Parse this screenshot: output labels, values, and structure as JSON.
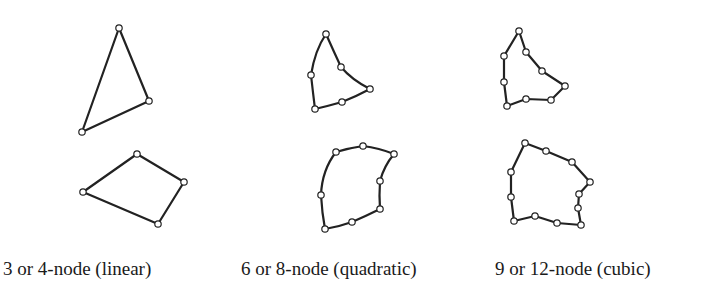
{
  "figure": {
    "colors": {
      "stroke": "#222222",
      "node_fill": "#ffffff",
      "text": "#1a1a1a",
      "background": "#ffffff"
    },
    "columns": [
      {
        "label": "3 or 4-node (linear)",
        "label_x": 3,
        "triangle": {
          "nodes": [
            [
              119,
              28
            ],
            [
              149,
              101
            ],
            [
              82,
              132
            ]
          ],
          "path": "M119,28 L149,101 L82,132 Z"
        },
        "quad": {
          "nodes": [
            [
              137,
              154
            ],
            [
              184,
              182
            ],
            [
              158,
              224
            ],
            [
              83,
              192
            ]
          ],
          "path": "M137,154 L184,182 L158,224 L83,192 Z"
        }
      },
      {
        "label": "6 or 8-node (quadratic)",
        "label_x": 241,
        "triangle": {
          "nodes": [
            [
              326,
              34
            ],
            [
              341,
              67
            ],
            [
              370,
              89
            ],
            [
              342,
              102
            ],
            [
              315,
              109
            ],
            [
              311,
              75
            ]
          ],
          "path": "M326,34 Q334,52 341,67 Q352,80 370,89 Q357,96 342,102 Q328,106 315,109 Q313,93 311,75 Q315,50 326,34 Z"
        },
        "quad": {
          "nodes": [
            [
              336,
              152
            ],
            [
              363,
              146
            ],
            [
              394,
              154
            ],
            [
              380,
              181
            ],
            [
              380,
              209
            ],
            [
              352,
              222
            ],
            [
              325,
              229
            ],
            [
              321,
              195
            ]
          ],
          "path": "M336,152 Q349,148 363,146 Q379,148 394,154 Q384,166 380,181 Q379,196 380,209 Q366,216 352,222 Q338,227 325,229 Q322,213 321,195 Q322,170 336,152 Z"
        }
      },
      {
        "label": "9 or 12-node (cubic)",
        "label_x": 495,
        "triangle": {
          "nodes": [
            [
              519,
              31
            ],
            [
              526,
              52
            ],
            [
              542,
              71
            ],
            [
              565,
              86
            ],
            [
              551,
              100
            ],
            [
              526,
              99
            ],
            [
              507,
              106
            ],
            [
              504,
              82
            ],
            [
              504,
              56
            ]
          ],
          "path": "M519,31 L526,52 L542,71 L565,86 L551,100 L526,99 L507,106 L504,82 L504,56 Z"
        },
        "quad": {
          "nodes": [
            [
              525,
              143
            ],
            [
              546,
              151
            ],
            [
              572,
              162
            ],
            [
              590,
              182
            ],
            [
              579,
              194
            ],
            [
              578,
              208
            ],
            [
              581,
              225
            ],
            [
              557,
              223
            ],
            [
              535,
              216
            ],
            [
              514,
              221
            ],
            [
              511,
              197
            ],
            [
              511,
              172
            ]
          ],
          "path": "M525,143 L546,151 L572,162 L590,182 L579,194 L578,208 L581,225 L557,223 L535,216 L514,221 L511,197 L511,172 Z"
        }
      }
    ]
  }
}
